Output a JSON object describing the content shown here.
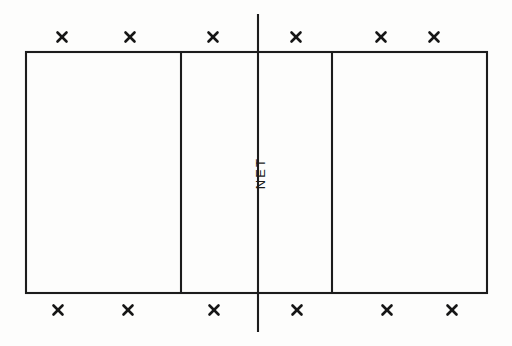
{
  "diagram": {
    "background_color": "#fdfdfc",
    "line_color": "#1c1c1c",
    "mark_color": "#161616"
  },
  "court": {
    "left": 26,
    "top": 52,
    "right": 487,
    "bottom": 293,
    "width": 461,
    "height": 241
  },
  "net": {
    "label": "NET",
    "x": 258,
    "top": 14,
    "bottom": 332,
    "label_x": 265,
    "label_y": 173,
    "rotation": -90
  },
  "attack_lines": [
    {
      "name": "left-attack-line",
      "x": 181,
      "top": 53,
      "bottom": 292
    },
    {
      "name": "right-attack-line",
      "x": 332,
      "top": 53,
      "bottom": 292
    }
  ],
  "marks": {
    "symbol": "X",
    "size": 9,
    "top_row": [
      {
        "id": "top-mark-1",
        "x": 62,
        "y": 37
      },
      {
        "id": "top-mark-2",
        "x": 130,
        "y": 37
      },
      {
        "id": "top-mark-3",
        "x": 213,
        "y": 37
      },
      {
        "id": "top-mark-4",
        "x": 296,
        "y": 37
      },
      {
        "id": "top-mark-5",
        "x": 381,
        "y": 37
      },
      {
        "id": "top-mark-6",
        "x": 434,
        "y": 37
      }
    ],
    "bottom_row": [
      {
        "id": "bottom-mark-1",
        "x": 58,
        "y": 310
      },
      {
        "id": "bottom-mark-2",
        "x": 128,
        "y": 310
      },
      {
        "id": "bottom-mark-3",
        "x": 214,
        "y": 310
      },
      {
        "id": "bottom-mark-4",
        "x": 297,
        "y": 310
      },
      {
        "id": "bottom-mark-5",
        "x": 387,
        "y": 310
      },
      {
        "id": "bottom-mark-6",
        "x": 452,
        "y": 310
      }
    ]
  }
}
